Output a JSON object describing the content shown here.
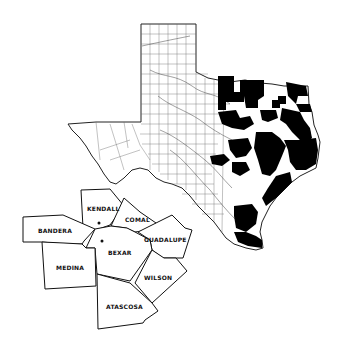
{
  "figure": {
    "title": ""
  },
  "colors": {
    "background": "#ffffff",
    "outline": "#222222",
    "shaded": "#000000",
    "grid": "#555555"
  },
  "main_map": {
    "name": "Texas",
    "legend": "Shaded counties shown in black"
  },
  "inset": {
    "counties": [
      {
        "name": "KENDALL"
      },
      {
        "name": "COMAL"
      },
      {
        "name": "BANDERA"
      },
      {
        "name": "GUADALUPE"
      },
      {
        "name": "BEXAR"
      },
      {
        "name": "MEDINA"
      },
      {
        "name": "WILSON"
      },
      {
        "name": "ATASCOSA"
      }
    ]
  }
}
